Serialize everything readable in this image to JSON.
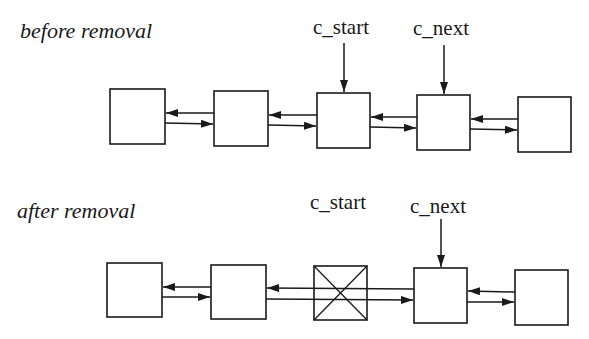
{
  "before": {
    "caption": "before removal",
    "labels": {
      "start": "c_start",
      "next": "c_next"
    },
    "nodes": [
      {
        "index": 0,
        "removed": false
      },
      {
        "index": 1,
        "removed": false
      },
      {
        "index": 2,
        "removed": false,
        "pointer": "c_start"
      },
      {
        "index": 3,
        "removed": false,
        "pointer": "c_next"
      },
      {
        "index": 4,
        "removed": false
      }
    ]
  },
  "after": {
    "caption": "after removal",
    "labels": {
      "start": "c_start",
      "next": "c_next"
    },
    "nodes": [
      {
        "index": 0,
        "removed": false
      },
      {
        "index": 1,
        "removed": false
      },
      {
        "index": 2,
        "removed": true
      },
      {
        "index": 3,
        "removed": false,
        "pointer": "c_next"
      },
      {
        "index": 4,
        "removed": false
      }
    ],
    "note": "links from node 1 and node 3 bypass the removed node 2; c_start no longer points to a node"
  },
  "colors": {
    "line": "#1a1a1a",
    "background": "#ffffff"
  }
}
